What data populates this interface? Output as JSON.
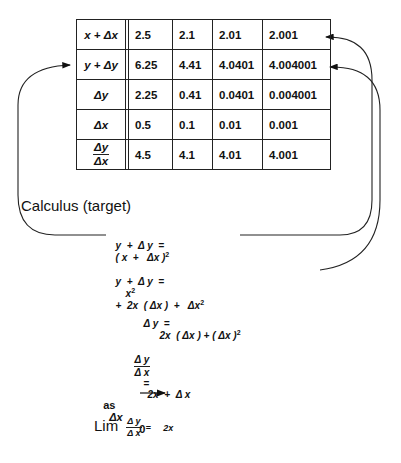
{
  "table": {
    "row_headers": [
      "x + Δx",
      "y + Δy",
      "Δy",
      "Δx",
      "Δy/Δx"
    ],
    "row_header_fraction": {
      "numerator": "Δy",
      "denominator": "Δx"
    },
    "rows": [
      [
        "2.5",
        "2.1",
        "2.01",
        "2.001"
      ],
      [
        "6.25",
        "4.41",
        "4.0401",
        "4.004001"
      ],
      [
        "2.25",
        "0.41",
        "0.0401",
        "0.004001"
      ],
      [
        "0.5",
        "0.1",
        "0.01",
        "0.001"
      ],
      [
        "4.5",
        "4.1",
        "4.01",
        "4.001"
      ]
    ]
  },
  "title": "Calculus (target)",
  "equations": {
    "eq1": {
      "lhs": "y  +  Δ y  =",
      "rhs": "( x  +   Δx )",
      "exp": "2"
    },
    "eq2": {
      "lhs": "y  +  Δ y  =",
      "rhs_a": "x",
      "exp_a": "2",
      "rhs_b": "+  2x  ( Δx )  +   Δx",
      "exp_b": "2"
    },
    "eq3": {
      "lhs": "Δ y  =",
      "rhs": "2x  ( Δx ) + ( Δx )",
      "exp": "2"
    },
    "eq4": {
      "num": "Δ y",
      "den": "Δ x",
      "eq": "=",
      "rhs": "2x  +  Δ x"
    },
    "eq5": {
      "as": "as",
      "var": "Δx",
      "target": "0"
    },
    "eq6": {
      "lim": "Lim",
      "num": "Δ y",
      "den": "Δ x",
      "eq": "=",
      "rhs": "2x"
    }
  },
  "arrows": [
    {
      "from": "eq1",
      "to": "row y + Δy (left)"
    },
    {
      "from": "eq1",
      "to": "x + Δx value 2.001"
    },
    {
      "from": "eq2",
      "to": "y + Δy value 4.004001"
    }
  ]
}
